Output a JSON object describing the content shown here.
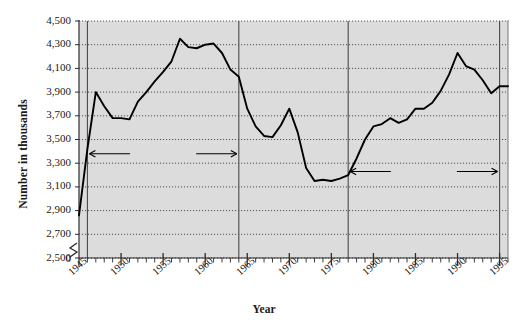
{
  "chart_data": {
    "type": "line",
    "title": "",
    "xlabel": "Year",
    "ylabel": "Number in thousands",
    "xlim": [
      1945,
      1996
    ],
    "ylim": [
      2500,
      4500
    ],
    "axis_break": true,
    "axis_break_label": "0",
    "grid": true,
    "grid_style": "dotted-horizontal",
    "legend": "none",
    "plot_bg": "#dcdcdc",
    "line_color": "#000000",
    "ytick_labels": [
      "4,500",
      "4,300",
      "4,100",
      "3,900",
      "3,700",
      "3,500",
      "3,300",
      "3,100",
      "2,900",
      "2,700",
      "2,500"
    ],
    "ytick_values": [
      4500,
      4300,
      4100,
      3900,
      3700,
      3500,
      3300,
      3100,
      2900,
      2700,
      2500
    ],
    "xtick_labels": [
      "1945",
      "1950",
      "1955",
      "1960",
      "1965",
      "1970",
      "1975",
      "1980",
      "1985",
      "1990",
      "1995"
    ],
    "xtick_values": [
      1945,
      1950,
      1955,
      1960,
      1965,
      1970,
      1975,
      1980,
      1985,
      1990,
      1995
    ],
    "minor_xticks_every": 1,
    "x": [
      1945,
      1946,
      1947,
      1948,
      1949,
      1950,
      1951,
      1952,
      1953,
      1954,
      1955,
      1956,
      1957,
      1958,
      1959,
      1960,
      1961,
      1962,
      1963,
      1964,
      1965,
      1966,
      1967,
      1968,
      1969,
      1970,
      1971,
      1972,
      1973,
      1974,
      1975,
      1976,
      1977,
      1978,
      1979,
      1980,
      1981,
      1982,
      1983,
      1984,
      1985,
      1986,
      1987,
      1988,
      1989,
      1990,
      1991,
      1992,
      1993,
      1994,
      1995,
      1996
    ],
    "values": [
      2860,
      3420,
      3900,
      3780,
      3680,
      3680,
      3670,
      3820,
      3900,
      3990,
      4070,
      4160,
      4350,
      4280,
      4270,
      4300,
      4310,
      4230,
      4090,
      4030,
      3760,
      3610,
      3530,
      3520,
      3620,
      3760,
      3560,
      3260,
      3150,
      3160,
      3150,
      3170,
      3200,
      3340,
      3500,
      3610,
      3630,
      3680,
      3640,
      3670,
      3760,
      3760,
      3810,
      3910,
      4050,
      4230,
      4120,
      4090,
      4000,
      3890,
      3950,
      3950
    ],
    "annotations": [
      {
        "id": "baby-boom",
        "label": "Baby Boom",
        "type": "double-arrow",
        "x_start": 1946,
        "x_end": 1964,
        "y": 3380
      },
      {
        "id": "baby-boom-total",
        "label": "75.9 million",
        "type": "text",
        "x": 1955,
        "y": 2840
      },
      {
        "id": "echo-boom",
        "label": "Echo Boom",
        "type": "double-arrow",
        "x_start": 1977,
        "x_end": 1995,
        "y": 3230
      },
      {
        "id": "echo-boom-total",
        "label": "72.3 million",
        "type": "text",
        "x": 1986,
        "y": 2830
      }
    ],
    "vertical_dividers": [
      {
        "id": "baby-boom-start",
        "x": 1946
      },
      {
        "id": "baby-boom-end",
        "x": 1964
      },
      {
        "id": "echo-boom-start",
        "x": 1977
      },
      {
        "id": "echo-boom-end",
        "x": 1995
      }
    ]
  }
}
